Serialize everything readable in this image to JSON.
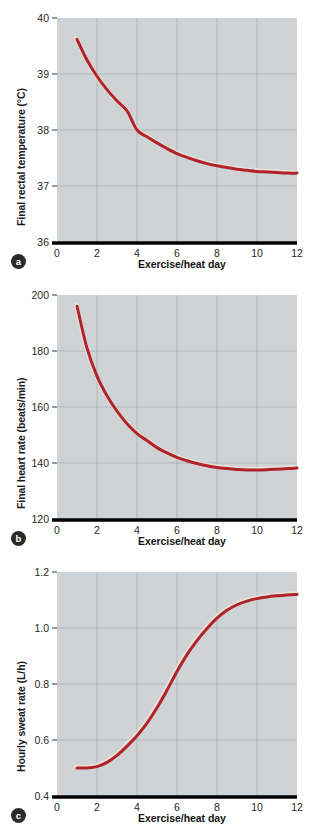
{
  "figure": {
    "background": "#ffffff",
    "plot_background": "#cfd3d5",
    "grid_color": "#9aa1a5",
    "curve_color": "#b0232a",
    "curve_highlight": "#e8e0d8",
    "axis_color": "#000000",
    "marker_fill": "#2b2b2b",
    "marker_text": "#ffffff"
  },
  "chart_data": [
    {
      "type": "line",
      "panel": "a",
      "title": "",
      "xlabel": "Exercise/heat day",
      "ylabel": "Final rectal temperature (°C)",
      "xlim": [
        0,
        12
      ],
      "ylim": [
        36,
        40
      ],
      "xticks": [
        "0",
        "2",
        "4",
        "6",
        "8",
        "10",
        "12"
      ],
      "xtick_values": [
        0,
        2,
        4,
        6,
        8,
        10,
        12
      ],
      "yticks": [
        "36",
        "37",
        "38",
        "39",
        "40"
      ],
      "ytick_values": [
        36,
        37,
        38,
        39,
        40
      ],
      "grid": true,
      "legend": "none",
      "x": [
        1,
        1.5,
        2,
        2.5,
        3,
        3.5,
        4,
        4.5,
        5,
        5.5,
        6,
        6.5,
        7,
        7.5,
        8,
        8.5,
        9,
        9.5,
        10,
        10.5,
        11,
        11.5,
        12
      ],
      "values": [
        39.62,
        39.25,
        38.96,
        38.72,
        38.52,
        38.34,
        38.0,
        37.88,
        37.77,
        37.67,
        37.58,
        37.51,
        37.45,
        37.4,
        37.36,
        37.33,
        37.3,
        37.28,
        37.26,
        37.25,
        37.24,
        37.23,
        37.23
      ]
    },
    {
      "type": "line",
      "panel": "b",
      "title": "",
      "xlabel": "Exercise/heat day",
      "ylabel": "Final heart rate (beats/min)",
      "xlim": [
        0,
        12
      ],
      "ylim": [
        120,
        200
      ],
      "xticks": [
        "0",
        "2",
        "4",
        "6",
        "8",
        "10",
        "12"
      ],
      "xtick_values": [
        0,
        2,
        4,
        6,
        8,
        10,
        12
      ],
      "yticks": [
        "120",
        "140",
        "160",
        "180",
        "200"
      ],
      "ytick_values": [
        120,
        140,
        160,
        180,
        200
      ],
      "grid": true,
      "legend": "none",
      "x": [
        1,
        1.5,
        2,
        2.5,
        3,
        3.5,
        4,
        4.5,
        5,
        5.5,
        6,
        6.5,
        7,
        7.5,
        8,
        8.5,
        9,
        9.5,
        10,
        10.5,
        11,
        11.5,
        12
      ],
      "values": [
        196.0,
        181.0,
        171.0,
        164.0,
        158.5,
        154.0,
        150.5,
        148.0,
        145.5,
        143.6,
        142.0,
        140.8,
        139.8,
        139.0,
        138.4,
        138.0,
        137.7,
        137.5,
        137.5,
        137.6,
        137.8,
        138.0,
        138.2
      ]
    },
    {
      "type": "line",
      "panel": "c",
      "title": "",
      "xlabel": "Exercise/heat day",
      "ylabel": "Hourly sweat rate (L/h)",
      "xlim": [
        0,
        12
      ],
      "ylim": [
        0.4,
        1.2
      ],
      "xticks": [
        "0",
        "2",
        "4",
        "6",
        "8",
        "10",
        "12"
      ],
      "xtick_values": [
        0,
        2,
        4,
        6,
        8,
        10,
        12
      ],
      "yticks": [
        "0.4",
        "0.6",
        "0.8",
        "1.0",
        "1.2"
      ],
      "ytick_values": [
        0.4,
        0.6,
        0.8,
        1.0,
        1.2
      ],
      "grid": true,
      "legend": "none",
      "x": [
        1,
        1.5,
        2,
        2.5,
        3,
        3.5,
        4,
        4.5,
        5,
        5.5,
        6,
        6.5,
        7,
        7.5,
        8,
        8.5,
        9,
        9.5,
        10,
        10.5,
        11,
        11.5,
        12
      ],
      "values": [
        0.5,
        0.5,
        0.505,
        0.52,
        0.545,
        0.578,
        0.615,
        0.66,
        0.715,
        0.778,
        0.845,
        0.905,
        0.955,
        0.998,
        1.035,
        1.063,
        1.083,
        1.096,
        1.105,
        1.111,
        1.115,
        1.118,
        1.12
      ]
    }
  ],
  "panels": [
    {
      "id": "a",
      "marker": "a"
    },
    {
      "id": "b",
      "marker": "b"
    },
    {
      "id": "c",
      "marker": "c"
    }
  ]
}
